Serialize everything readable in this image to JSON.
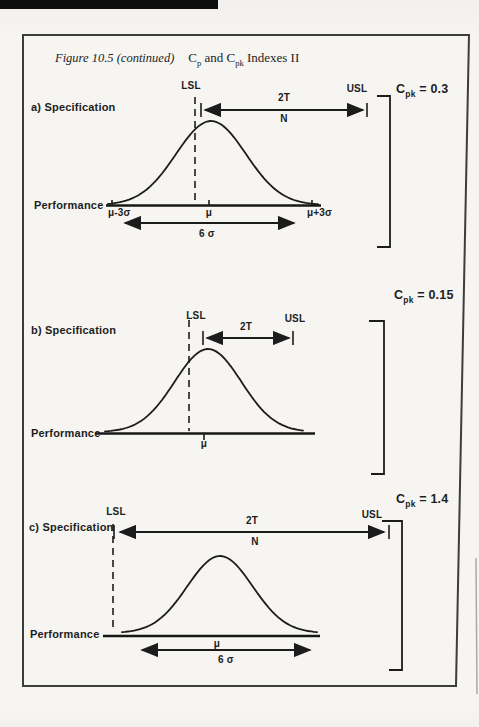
{
  "title": {
    "caption": "Figure 10.5 (continued)",
    "c1": "C",
    "sub1": "p",
    "mid": " and ",
    "c2": "C",
    "sub2": "pk",
    "rest": " Indexes II"
  },
  "diagrams": [
    {
      "label": "a) Specification",
      "performance": "Performance",
      "cpk_c": "C",
      "cpk_sub": "pk",
      "cpk_eq": " = 0.3",
      "lsl": "LSL",
      "usl": "USL",
      "tol": "2T",
      "nominal": "N",
      "mu_minus": "μ-3σ",
      "mu": "μ",
      "mu_plus": "μ+3σ",
      "six_sigma": "6 σ"
    },
    {
      "label": "b) Specification",
      "performance": "Performance",
      "cpk_c": "C",
      "cpk_sub": "pk",
      "cpk_eq": " = 0.15",
      "lsl": "LSL",
      "usl": "USL",
      "tol": "2T",
      "mu": "μ"
    },
    {
      "label": "c) Specification",
      "performance": "Performance",
      "cpk_c": "C",
      "cpk_sub": "pk",
      "cpk_eq": " = 1.4",
      "lsl": "LSL",
      "usl": "USL",
      "tol": "2T",
      "nominal": "N",
      "mu": "μ",
      "six_sigma": "6 σ"
    }
  ]
}
